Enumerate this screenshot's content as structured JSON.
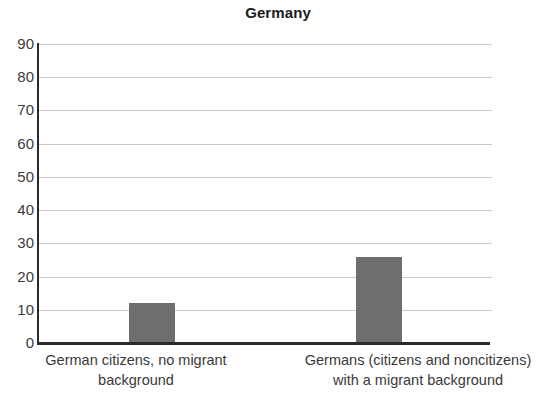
{
  "chart_data": {
    "type": "bar",
    "title": "Germany",
    "subtitle": "",
    "xlabel": "",
    "ylabel": "",
    "categories": [
      "German citizens, no migrant background",
      "Germans (citizens and noncitizens) with a migrant background"
    ],
    "category_lines": [
      [
        "German citizens, no migrant",
        "background"
      ],
      [
        "Germans (citizens and noncitizens)",
        "with a migrant background"
      ]
    ],
    "values": [
      12,
      26
    ],
    "ylim": [
      0,
      90
    ],
    "yticks": [
      0,
      10,
      20,
      30,
      40,
      50,
      60,
      70,
      80,
      90
    ],
    "ytick_labels": [
      "0",
      "10",
      "20",
      "30",
      "40",
      "50",
      "60",
      "70",
      "80",
      "90"
    ],
    "grid": true,
    "grid_axis": "y",
    "legend": false,
    "legend_position": "none",
    "bar_color": "#6e6e6e",
    "gridline_color": "#c9c9c9",
    "axis_color": "#2a2a2a",
    "title_color": "#1b1b1b",
    "tick_label_color": "#3b3b3b",
    "background_color": "#ffffff"
  }
}
